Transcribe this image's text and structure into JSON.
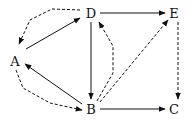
{
  "diagram": {
    "type": "directed-graph",
    "nodes": [
      {
        "id": "A",
        "label": "A",
        "x": 15,
        "y": 61
      },
      {
        "id": "D",
        "label": "D",
        "x": 91,
        "y": 13
      },
      {
        "id": "E",
        "label": "E",
        "x": 173,
        "y": 13
      },
      {
        "id": "B",
        "label": "B",
        "x": 91,
        "y": 109
      },
      {
        "id": "C",
        "label": "C",
        "x": 173,
        "y": 109
      }
    ],
    "edges": [
      {
        "from": "A",
        "to": "D",
        "style": "solid"
      },
      {
        "from": "D",
        "to": "A",
        "style": "dashed"
      },
      {
        "from": "B",
        "to": "A",
        "style": "solid"
      },
      {
        "from": "A",
        "to": "B",
        "style": "dashed"
      },
      {
        "from": "D",
        "to": "B",
        "style": "solid"
      },
      {
        "from": "B",
        "to": "D",
        "style": "dashed"
      },
      {
        "from": "D",
        "to": "E",
        "style": "solid"
      },
      {
        "from": "B",
        "to": "E",
        "style": "dashed"
      },
      {
        "from": "E",
        "to": "C",
        "style": "dashed"
      },
      {
        "from": "B",
        "to": "C",
        "style": "solid"
      }
    ],
    "colors": {
      "stroke": "#111111",
      "background": "#ffffff"
    }
  }
}
